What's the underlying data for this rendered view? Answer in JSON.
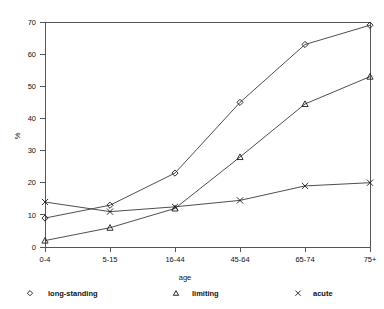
{
  "chart_data": {
    "type": "line",
    "title": "",
    "xlabel": "age",
    "ylabel": "%",
    "categories": [
      "0-4",
      "5-15",
      "16-44",
      "45-64",
      "65-74",
      "75+"
    ],
    "series": [
      {
        "name": "long-standing",
        "marker": "diamond",
        "values": [
          9,
          13,
          23,
          45,
          63,
          69
        ]
      },
      {
        "name": "limiting",
        "marker": "triangle",
        "values": [
          2,
          6,
          12,
          28,
          44.5,
          53
        ]
      },
      {
        "name": "acute",
        "marker": "cross",
        "values": [
          14,
          11,
          12.5,
          14.5,
          19,
          20
        ]
      }
    ],
    "ylim": [
      0,
      70
    ],
    "yticks": [
      0,
      10,
      20,
      30,
      40,
      50,
      60,
      70
    ],
    "ytick_labels": [
      "0",
      "10",
      "20",
      "30",
      "40",
      "50",
      "60",
      "70"
    ],
    "grid": false,
    "legend_position": "bottom",
    "legend": [
      {
        "label": "long-standing",
        "marker": "diamond"
      },
      {
        "label": "limiting",
        "marker": "triangle"
      },
      {
        "label": "acute",
        "marker": "cross"
      }
    ],
    "colors": {
      "line": "#3a3a3a",
      "axis": "#555555",
      "text": "#111111",
      "background": "#ffffff"
    }
  }
}
